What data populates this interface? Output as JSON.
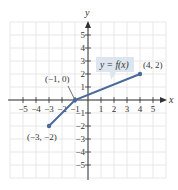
{
  "chart_data": {
    "type": "line",
    "title": "",
    "xlabel": "x",
    "ylabel": "y",
    "xlim": [
      -6,
      6
    ],
    "ylim": [
      -6,
      6
    ],
    "grid": true,
    "x_ticks": [
      -5,
      -4,
      -3,
      -2,
      -1,
      1,
      2,
      3,
      4,
      5
    ],
    "y_ticks": [
      -5,
      -4,
      -3,
      -2,
      -1,
      1,
      2,
      3,
      4,
      5
    ],
    "x_tick_labels": [
      "−5",
      "−4",
      "−3",
      "−2",
      "−1",
      "1",
      "2",
      "3",
      "4",
      "5"
    ],
    "y_tick_labels": [
      "−5",
      "−4",
      "−3",
      "−2",
      "−1",
      "1",
      "2",
      "3",
      "4",
      "5"
    ],
    "series": [
      {
        "name": "y = f(x)",
        "points": [
          [
            -3,
            -2
          ],
          [
            -1,
            0
          ],
          [
            4,
            2
          ]
        ],
        "color": "#4a6a9a"
      }
    ],
    "annotations": [
      {
        "text": "(−3, −2)",
        "x": -3,
        "y": -2
      },
      {
        "text": "(−1, 0)",
        "x": -1,
        "y": 0
      },
      {
        "text": "(4, 2)",
        "x": 4,
        "y": 2
      },
      {
        "text": "y = f(x)",
        "type": "callout"
      }
    ]
  },
  "labels": {
    "x_axis": "x",
    "y_axis": "y",
    "callout": "y = f(x)",
    "pt_a": "(−3, −2)",
    "pt_b": "(−1, 0)",
    "pt_c": "(4, 2)"
  },
  "colors": {
    "line": "#4a6a9a",
    "callout_fill": "#dde6ee",
    "grid": "#e2e2e2",
    "axis": "#333333"
  }
}
